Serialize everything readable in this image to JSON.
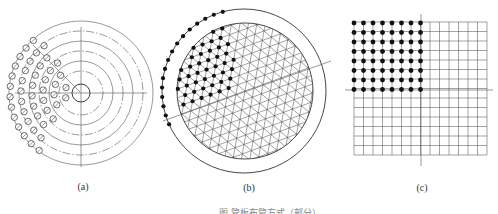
{
  "figure": {
    "caption": "图 管板布管方式（部分）",
    "panels": [
      {
        "id": "a",
        "label": "(a)",
        "type": "concentric-circle-arrangement",
        "center": [
          81,
          93
        ],
        "ring_radii_solid": [
          9,
          32,
          52,
          72
        ],
        "ring_radii_dashdot": [
          22,
          42,
          62
        ],
        "tube_ring_radii": [
          16,
          27,
          38,
          49,
          60,
          71
        ],
        "tube_radius": 3.2,
        "tube_angle_start_deg": 128,
        "tube_angle_end_deg": 236,
        "tube_spacing": 10.5
      },
      {
        "id": "b",
        "label": "(b)",
        "type": "triangular-arrangement",
        "shell_center": [
          244,
          91
        ],
        "shell_radius": 82,
        "tubesheet_radius": 68,
        "pitch": 9.6,
        "filled_tube_count_approx": 60
      },
      {
        "id": "c",
        "label": "(c)",
        "type": "square-arrangement",
        "grid_origin": [
          354,
          22
        ],
        "pitch": 9.5,
        "columns": 14,
        "rows": 14,
        "filled_columns": 8,
        "filled_rows": 8
      }
    ]
  },
  "colors": {
    "line": "#555555",
    "ink": "#111111",
    "background": "#ffffff"
  }
}
